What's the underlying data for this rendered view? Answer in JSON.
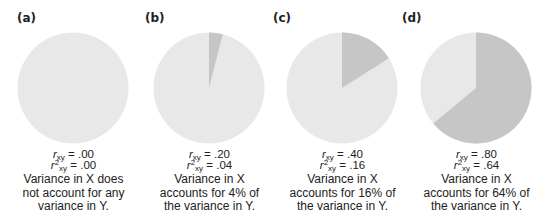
{
  "chart_data": {
    "type": "pie",
    "title": "",
    "colors": {
      "unexplained": "#e8e8e8",
      "explained": "#c6c6c6"
    },
    "panels": [
      {
        "label": "(a)",
        "r": ".00",
        "r2": ".00",
        "explained_pct": 0,
        "desc": [
          "Variance in X does",
          "not account for any",
          "variance in Y."
        ]
      },
      {
        "label": "(b)",
        "r": ".20",
        "r2": ".04",
        "explained_pct": 4,
        "desc": [
          "Variance in X",
          "accounts for 4% of",
          "the variance in Y."
        ]
      },
      {
        "label": "(c)",
        "r": ".40",
        "r2": ".16",
        "explained_pct": 16,
        "desc": [
          "Variance in X",
          "accounts for 16% of",
          "the variance in Y."
        ]
      },
      {
        "label": "(d)",
        "r": ".80",
        "r2": ".64",
        "explained_pct": 64,
        "desc": [
          "Variance in X",
          "accounts for 64% of",
          "the variance in Y."
        ]
      }
    ]
  },
  "text": {
    "r_sym": "r",
    "sub": "xy",
    "sup": "2",
    "eq": " = "
  }
}
